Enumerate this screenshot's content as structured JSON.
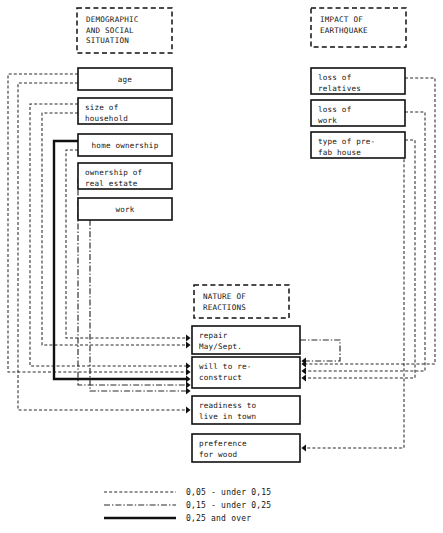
{
  "figure": {
    "title_groups": [
      {
        "id": "demographic",
        "label_lines": [
          "DEMOGRAPHIC",
          "AND SOCIAL",
          "SITUATION"
        ],
        "x": 77,
        "y": 8,
        "w": 95,
        "h": 45
      },
      {
        "id": "impact",
        "label_lines": [
          "IMPACT OF",
          "EARTHQUAKE"
        ],
        "x": 311,
        "y": 8,
        "w": 95,
        "h": 39
      },
      {
        "id": "reactions",
        "label_lines": [
          "NATURE OF",
          "REACTIONS"
        ],
        "x": 194,
        "y": 285,
        "w": 95,
        "h": 33
      }
    ],
    "left_boxes": [
      {
        "id": "age",
        "label_lines": [
          "age"
        ],
        "x": 78,
        "y": 68,
        "w": 94,
        "h": 22
      },
      {
        "id": "size-of-household",
        "label_lines": [
          "size of",
          "household"
        ],
        "x": 78,
        "y": 98,
        "w": 94,
        "h": 26
      },
      {
        "id": "home-ownership",
        "label_lines": [
          "home ownership"
        ],
        "x": 78,
        "y": 134,
        "w": 94,
        "h": 22
      },
      {
        "id": "ownership-of-real-estate",
        "label_lines": [
          "ownership of",
          "real estate"
        ],
        "x": 78,
        "y": 163,
        "w": 94,
        "h": 26
      },
      {
        "id": "work",
        "label_lines": [
          "work"
        ],
        "x": 78,
        "y": 198,
        "w": 94,
        "h": 22
      }
    ],
    "right_boxes": [
      {
        "id": "loss-of-relatives",
        "label_lines": [
          "loss of",
          "relatives"
        ],
        "x": 311,
        "y": 68,
        "w": 94,
        "h": 26
      },
      {
        "id": "loss-of-work",
        "label_lines": [
          "loss of",
          "work"
        ],
        "x": 311,
        "y": 100,
        "w": 94,
        "h": 26
      },
      {
        "id": "type-of-prefab-house",
        "label_lines": [
          "type of pre-",
          "fab house"
        ],
        "x": 311,
        "y": 132,
        "w": 94,
        "h": 26
      }
    ],
    "center_boxes": [
      {
        "id": "repair-may-sept",
        "label_lines": [
          "repair",
          "May/Sept."
        ],
        "x": 192,
        "y": 326,
        "w": 108,
        "h": 28
      },
      {
        "id": "will-to-reconstruct",
        "label_lines": [
          "will to re-",
          "construct"
        ],
        "x": 192,
        "y": 357,
        "w": 108,
        "h": 31
      },
      {
        "id": "readiness-to-live-in-town",
        "label_lines": [
          "readiness to",
          "live in town"
        ],
        "x": 192,
        "y": 396,
        "w": 108,
        "h": 28
      },
      {
        "id": "preference-for-wood",
        "label_lines": [
          "preference",
          "for wood"
        ],
        "x": 192,
        "y": 434,
        "w": 108,
        "h": 28
      }
    ],
    "legend": {
      "x": 104,
      "y": 492,
      "entries": [
        {
          "style": "weak",
          "label": "0,05 - under 0,15"
        },
        {
          "style": "mid",
          "label": "0,15 - under 0,25"
        },
        {
          "style": "strong",
          "label": "0,25 and over"
        }
      ]
    },
    "caption": "",
    "edges": [
      {
        "from": "age",
        "to": "will-to-reconstruct",
        "style": "weak",
        "path": "M78,74 L8,74 L8,372 L186,372",
        "arrow": "right"
      },
      {
        "from": "age",
        "to": "readiness-to-live-in-town",
        "style": "weak",
        "path": "M78,83 L18,83 L18,410 L186,410",
        "arrow": "right"
      },
      {
        "from": "size-of-household",
        "to": "will-to-reconstruct",
        "style": "weak",
        "path": "M78,104 L30,104 L30,366 L186,366",
        "arrow": "right"
      },
      {
        "from": "size-of-household",
        "to": "repair-may-sept",
        "style": "weak",
        "path": "M78,113 L42,113 L42,345 L186,345",
        "arrow": "right"
      },
      {
        "from": "home-ownership",
        "to": "will-to-reconstruct",
        "style": "strong",
        "path": "M78,141 L54,141 L54,379 L186,379",
        "arrow": "right"
      },
      {
        "from": "home-ownership",
        "to": "repair-may-sept",
        "style": "weak",
        "path": "M78,150 L66,150 L66,338 L186,338",
        "arrow": "right"
      },
      {
        "from": "ownership-of-real-estate",
        "to": "will-to-reconstruct",
        "style": "mid",
        "path": "M78,178 L78,178 L78,385 L186,385",
        "arrow": "right"
      },
      {
        "from": "work",
        "to": "will-to-reconstruct",
        "style": "mid",
        "path": "M78,209 L90,209 L90,391 L186,391",
        "arrow": "right"
      },
      {
        "from": "loss-of-relatives",
        "to": "will-to-reconstruct",
        "style": "weak",
        "path": "M405,78 L435,78 L435,364 L306,364",
        "arrow": "left"
      },
      {
        "from": "loss-of-work",
        "to": "will-to-reconstruct",
        "style": "weak",
        "path": "M405,112 L425,112 L425,371 L306,371",
        "arrow": "left"
      },
      {
        "from": "type-of-prefab-house",
        "to": "will-to-reconstruct",
        "style": "weak",
        "path": "M405,140 L415,140 L415,378 L306,378",
        "arrow": "left"
      },
      {
        "from": "type-of-prefab-house",
        "to": "preference-for-wood",
        "style": "weak",
        "path": "M405,150 L404,150 L404,448 L306,448",
        "arrow": "left"
      },
      {
        "from": "repair-may-sept",
        "to": "will-to-reconstruct",
        "style": "mid",
        "path": "M300,340 L340,340 L340,361 L306,361",
        "arrow": "left"
      }
    ]
  }
}
